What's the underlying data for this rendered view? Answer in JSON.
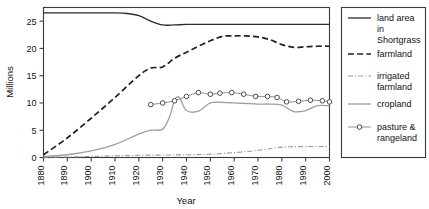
{
  "chart_data": {
    "type": "line",
    "title": "",
    "xlabel": "Year",
    "ylabel": "Millions",
    "xlim": [
      1880,
      2000
    ],
    "ylim": [
      0,
      27.5
    ],
    "xticks": [
      1880,
      1890,
      1900,
      1910,
      1920,
      1930,
      1940,
      1950,
      1960,
      1970,
      1980,
      1990,
      2000
    ],
    "yticks": [
      0,
      5,
      10,
      15,
      20,
      25
    ],
    "grid": false,
    "legend_position": "right-outside",
    "series": [
      {
        "name": "land area in Shortgrass",
        "style": "solid-dark",
        "x": [
          1880,
          1890,
          1900,
          1910,
          1915,
          1920,
          1925,
          1930,
          1935,
          1940,
          1950,
          1960,
          1970,
          1980,
          1990,
          2000
        ],
        "values": [
          26.5,
          26.5,
          26.5,
          26.5,
          26.4,
          26.0,
          25.0,
          24.3,
          24.3,
          24.4,
          24.4,
          24.4,
          24.4,
          24.4,
          24.4,
          24.4
        ]
      },
      {
        "name": "farmland",
        "style": "dashed-dark",
        "x": [
          1880,
          1890,
          1900,
          1910,
          1920,
          1925,
          1930,
          1935,
          1940,
          1945,
          1950,
          1955,
          1960,
          1965,
          1970,
          1975,
          1980,
          1985,
          1990,
          1995,
          2000
        ],
        "values": [
          0.5,
          3.6,
          7.2,
          11.0,
          15.0,
          16.4,
          16.6,
          18.2,
          19.3,
          20.4,
          21.4,
          22.2,
          22.3,
          22.3,
          22.1,
          21.6,
          20.7,
          20.2,
          20.3,
          20.4,
          20.4
        ]
      },
      {
        "name": "irrigated farmland",
        "style": "dashdot-light",
        "x": [
          1880,
          1890,
          1900,
          1910,
          1920,
          1930,
          1940,
          1950,
          1960,
          1970,
          1980,
          1990,
          2000
        ],
        "values": [
          0.05,
          0.1,
          0.2,
          0.3,
          0.4,
          0.45,
          0.5,
          0.6,
          0.9,
          1.3,
          1.9,
          2.0,
          2.0
        ]
      },
      {
        "name": "cropland",
        "style": "solid-light",
        "x": [
          1880,
          1890,
          1900,
          1910,
          1920,
          1925,
          1930,
          1933,
          1935,
          1937,
          1940,
          1945,
          1950,
          1955,
          1960,
          1965,
          1970,
          1975,
          1980,
          1985,
          1990,
          1995,
          2000
        ],
        "values": [
          0.2,
          0.5,
          1.2,
          2.4,
          4.3,
          5.0,
          5.2,
          7.6,
          10.5,
          11.0,
          8.6,
          8.5,
          10.0,
          10.1,
          10.0,
          9.9,
          9.8,
          9.8,
          9.6,
          8.4,
          8.6,
          9.5,
          9.5
        ]
      },
      {
        "name": "pasture & rangeland",
        "style": "markers-circle",
        "x": [
          1925,
          1930,
          1935,
          1940,
          1945,
          1950,
          1954,
          1959,
          1964,
          1969,
          1974,
          1978,
          1982,
          1987,
          1992,
          1997,
          2000
        ],
        "values": [
          9.7,
          10.0,
          10.4,
          11.2,
          11.9,
          11.6,
          11.8,
          11.9,
          11.6,
          11.2,
          11.2,
          11.0,
          10.2,
          10.3,
          10.5,
          10.4,
          10.2
        ]
      }
    ]
  },
  "legend": {
    "items": [
      {
        "label_line1": "land area",
        "label_line2": "in",
        "label_line3": "Shortgrass",
        "style": "solid-dark"
      },
      {
        "label_line1": "farmland",
        "label_line2": "",
        "label_line3": "",
        "style": "dashed-dark"
      },
      {
        "label_line1": "irrigated",
        "label_line2": "farmland",
        "label_line3": "",
        "style": "dashdot-light"
      },
      {
        "label_line1": "cropland",
        "label_line2": "",
        "label_line3": "",
        "style": "solid-light"
      },
      {
        "label_line1": "pasture &",
        "label_line2": "rangeland",
        "label_line3": "",
        "style": "markers-circle"
      }
    ]
  },
  "axes": {
    "y_title": "Millions",
    "x_title": "Year",
    "ytick_labels": [
      "0",
      "5",
      "10",
      "15",
      "20",
      "25"
    ],
    "xtick_labels": [
      "1880",
      "1890",
      "1900",
      "1910",
      "1920",
      "1930",
      "1940",
      "1950",
      "1960",
      "1970",
      "1980",
      "1990",
      "2000"
    ]
  }
}
